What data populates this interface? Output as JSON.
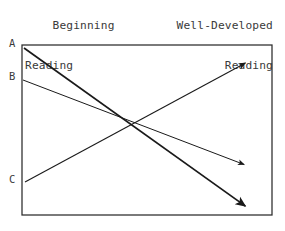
{
  "figure": {
    "title_left": "Beginning\nReading",
    "title_right": "Well-Developed\nReading",
    "header_left_line1": "Beginning",
    "header_left_line2": "Reading",
    "header_right_line1": "Well-Developed",
    "header_right_line2": "Reading",
    "axis_label_a": "A",
    "axis_label_b": "B",
    "axis_label_c": "C",
    "colors": {
      "ink": "#1a1a1a",
      "text": "#3a3a3a",
      "frame": "#2b2b2b",
      "background": "#ffffff"
    }
  },
  "chart_data": {
    "type": "line",
    "title": "",
    "subtitle": "",
    "xlabel": "",
    "ylabel": "",
    "x_axis_left_label": "Beginning Reading",
    "x_axis_right_label": "Well-Developed Reading",
    "xlim": [
      0,
      1
    ],
    "ylim": [
      0,
      1
    ],
    "grid": false,
    "legend": "none",
    "y_tick_labels": [
      "A",
      "B",
      "C"
    ],
    "y_tick_values": [
      0.982,
      0.794,
      0.194
    ],
    "plot_box": {
      "x0": 22,
      "y0": 45,
      "x1": 272,
      "y1": 215
    },
    "annotations": [
      "Three trajectories cross near the midpoint of the reading-development span."
    ],
    "series": [
      {
        "name": "A",
        "start_label": "A",
        "start": {
          "x": 0.008,
          "y": 0.982
        },
        "end": {
          "x": 0.904,
          "y": 0.041
        },
        "direction": "decreasing",
        "arrow": "end",
        "weight": "heavy",
        "pixel_start": {
          "x": 24,
          "y": 48
        },
        "pixel_end": {
          "x": 248,
          "y": 208
        }
      },
      {
        "name": "B",
        "start_label": "B",
        "start": {
          "x": 0.004,
          "y": 0.794
        },
        "end": {
          "x": 0.904,
          "y": 0.288
        },
        "direction": "decreasing",
        "arrow": "end",
        "weight": "light",
        "pixel_start": {
          "x": 23,
          "y": 80
        },
        "pixel_end": {
          "x": 248,
          "y": 166
        }
      },
      {
        "name": "C",
        "start_label": "C",
        "start": {
          "x": 0.012,
          "y": 0.194
        },
        "end": {
          "x": 0.908,
          "y": 0.906
        },
        "direction": "increasing",
        "arrow": "end",
        "weight": "medium",
        "pixel_start": {
          "x": 25,
          "y": 182
        },
        "pixel_end": {
          "x": 249,
          "y": 61
        }
      }
    ],
    "crossing_point": {
      "x": 0.436,
      "y": 0.547,
      "pixel": {
        "x": 131,
        "y": 122
      }
    }
  }
}
